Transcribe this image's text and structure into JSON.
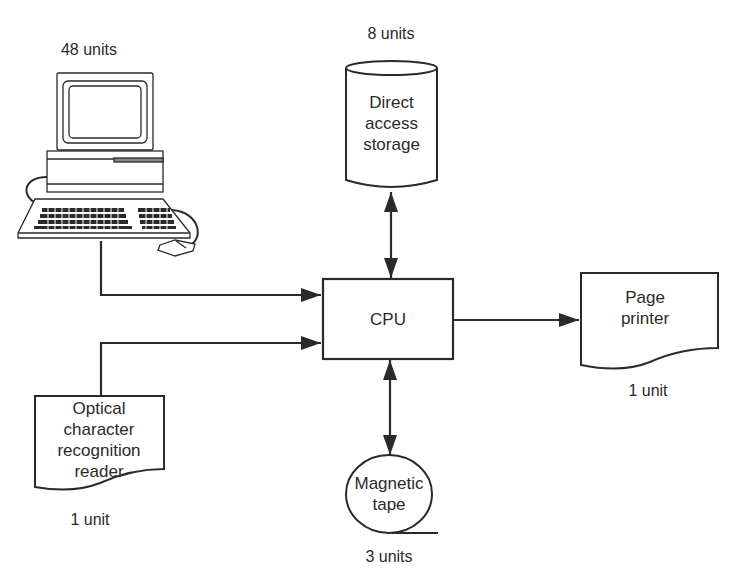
{
  "diagram": {
    "type": "computer system block diagram",
    "colors": {
      "stroke": "#2a2a2a",
      "background": "#ffffff"
    },
    "nodes": {
      "terminal": {
        "icon": "computer-terminal-icon",
        "count_label": "48 units"
      },
      "storage": {
        "shape": "cylinder",
        "label_lines": [
          "Direct",
          "access",
          "storage"
        ],
        "count_label": "8 units"
      },
      "cpu": {
        "shape": "rectangle",
        "label": "CPU"
      },
      "printer": {
        "shape": "document",
        "label_lines": [
          "Page",
          "printer"
        ],
        "count_label": "1 unit"
      },
      "ocr": {
        "shape": "document",
        "label_lines": [
          "Optical",
          "character",
          "recognition",
          "reader"
        ],
        "count_label": "1 unit"
      },
      "tape": {
        "shape": "magnetic-tape",
        "label_lines": [
          "Magnetic",
          "tape"
        ],
        "count_label": "3 units"
      }
    },
    "edges": [
      {
        "from": "terminal",
        "to": "cpu",
        "direction": "one-way"
      },
      {
        "from": "ocr",
        "to": "cpu",
        "direction": "one-way"
      },
      {
        "from": "storage",
        "to": "cpu",
        "direction": "two-way"
      },
      {
        "from": "cpu",
        "to": "printer",
        "direction": "one-way"
      },
      {
        "from": "cpu",
        "to": "tape",
        "direction": "two-way"
      }
    ]
  }
}
